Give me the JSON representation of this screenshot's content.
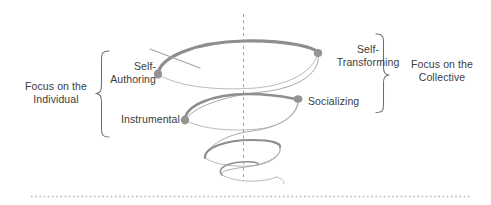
{
  "diagram": {
    "axis": {
      "name": "vertical-center-axis",
      "style": "dashed",
      "x": 243,
      "y_top": 14,
      "y_bottom": 181,
      "color": "#9a9a9a"
    },
    "bottom_rule": {
      "name": "bottom-dotted-rule",
      "style": "dotted",
      "y": 196,
      "color": "#b5b5b5"
    },
    "colors": {
      "spiral_front": "#8e8e8e",
      "spiral_back": "#b0b0b0",
      "marker": "#949494",
      "bracket": "#6f6f6f",
      "text": "#3c3c3c",
      "background": "#ffffff"
    },
    "left_group": {
      "label": "Focus on the\nIndividual",
      "bracket": "left-curly-brace",
      "stages": [
        {
          "key": "self-authoring",
          "label": "Self-\nAuthoring",
          "marker_x": 158,
          "marker_y": 74
        },
        {
          "key": "instrumental",
          "label": "Instrumental",
          "marker_x": 185,
          "marker_y": 120
        }
      ]
    },
    "right_group": {
      "label": "Focus on the\nCollective",
      "bracket": "right-curly-brace",
      "stages": [
        {
          "key": "self-transforming",
          "label": "Self-\nTransforming",
          "marker_x": 318,
          "marker_y": 53
        },
        {
          "key": "socializing",
          "label": "Socializing",
          "marker_x": 298,
          "marker_y": 99
        }
      ]
    },
    "spiral": {
      "name": "conical-helix",
      "turns": 3,
      "direction": "narrowing-downward",
      "tail": {
        "name": "upper-left-tail",
        "x1": 150,
        "y1": 50,
        "x2": 196,
        "y2": 67
      }
    }
  }
}
